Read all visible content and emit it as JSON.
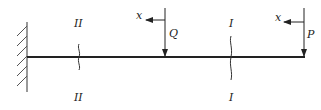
{
  "diagram": {
    "type": "cantilever-beam",
    "support": "fixed-wall-left",
    "sections": [
      {
        "id": "II",
        "top_label": "II",
        "bottom_label": "II"
      },
      {
        "id": "I",
        "top_label": "I",
        "bottom_label": "I"
      }
    ],
    "loads": [
      {
        "name": "Q",
        "label": "Q",
        "coord_label": "x",
        "direction": "downward"
      },
      {
        "name": "P",
        "label": "P",
        "coord_label": "x",
        "direction": "downward"
      }
    ]
  }
}
